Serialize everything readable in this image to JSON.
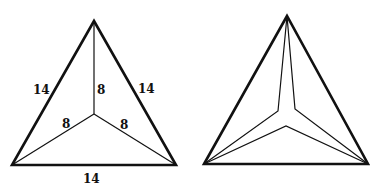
{
  "figures": [
    {
      "name": "labeled-triangle",
      "outer": {
        "apex": [
          94,
          21
        ],
        "left": [
          12,
          165
        ],
        "right": [
          176,
          165
        ]
      },
      "center": [
        94,
        114
      ],
      "labels": {
        "left_side": "14",
        "right_side": "14",
        "bottom_side": "14",
        "spoke_top": "8",
        "spoke_left": "8",
        "spoke_right": "8"
      }
    },
    {
      "name": "folded-triangle",
      "outer": {
        "apex": [
          287,
          16
        ],
        "left": [
          204,
          164
        ],
        "right": [
          368,
          164
        ]
      },
      "inner": {
        "upper_left": [
          278,
          111
        ],
        "upper_right": [
          295,
          109
        ],
        "lower": [
          286,
          126
        ]
      }
    }
  ],
  "colors": {
    "stroke": "#111111",
    "background": "#ffffff"
  }
}
